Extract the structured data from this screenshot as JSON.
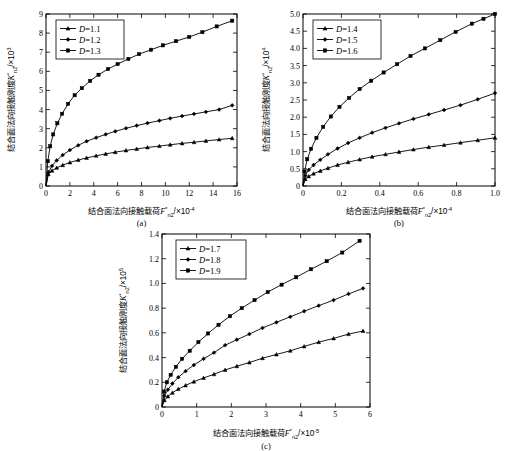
{
  "figure": {
    "background": "#ffffff",
    "ink": "#000000",
    "panels": [
      "a",
      "b",
      "c"
    ]
  },
  "chart_data": [
    {
      "id": "a",
      "type": "line",
      "caption": "(a)",
      "title": "",
      "xlabel_cn": "结合面法向接触载荷",
      "xlabel_sym": "F",
      "xlabel_sym_sup": "*",
      "xlabel_sym_sub": "n2",
      "xlabel_scale": "/×10",
      "xlabel_exp": "-4",
      "ylabel_cn": "结合面法向接触刚度",
      "ylabel_sym": "K",
      "ylabel_sym_sup": "*",
      "ylabel_sym_sub": "n2",
      "ylabel_scale": "/×10",
      "ylabel_exp": "3",
      "xlim": [
        0,
        16
      ],
      "ylim": [
        0,
        9
      ],
      "xticks": [
        0,
        2,
        4,
        6,
        8,
        10,
        12,
        14,
        16
      ],
      "xticklabels": [
        "0",
        "2",
        "4",
        "6",
        "8",
        "10",
        "12",
        "14",
        "16"
      ],
      "yticks": [
        0,
        1,
        2,
        3,
        4,
        5,
        6,
        7,
        8,
        9
      ],
      "yticklabels": [
        "0",
        "1",
        "2",
        "3",
        "4",
        "5",
        "6",
        "7",
        "8",
        "9"
      ],
      "grid": false,
      "legend_position": "upper-left",
      "series": [
        {
          "name": "D=1.1",
          "label_var": "D",
          "label_val": "1.1",
          "marker": "triangle",
          "x": [
            0,
            0.2,
            0.5,
            0.9,
            1.4,
            2.0,
            2.7,
            3.4,
            4.2,
            5.0,
            5.8,
            6.7,
            7.6,
            8.5,
            9.5,
            10.4,
            11.4,
            12.4,
            13.4,
            14.5,
            15.6
          ],
          "y": [
            0,
            0.62,
            0.8,
            0.95,
            1.09,
            1.23,
            1.36,
            1.47,
            1.58,
            1.68,
            1.77,
            1.86,
            1.94,
            2.02,
            2.09,
            2.16,
            2.23,
            2.29,
            2.36,
            2.43,
            2.5
          ]
        },
        {
          "name": "D=1.2",
          "label_var": "D",
          "label_val": "1.2",
          "marker": "diamond",
          "x": [
            0,
            0.2,
            0.5,
            0.9,
            1.4,
            2.0,
            2.7,
            3.4,
            4.2,
            5.0,
            5.8,
            6.7,
            7.6,
            8.5,
            9.5,
            10.4,
            11.4,
            12.4,
            13.4,
            14.5,
            15.6
          ],
          "y": [
            0,
            0.72,
            1.05,
            1.34,
            1.62,
            1.88,
            2.13,
            2.34,
            2.53,
            2.7,
            2.86,
            3.02,
            3.16,
            3.29,
            3.42,
            3.54,
            3.66,
            3.77,
            3.88,
            4.0,
            4.22
          ]
        },
        {
          "name": "D=1.3",
          "label_var": "D",
          "label_val": "1.3",
          "marker": "square",
          "x": [
            0,
            0.15,
            0.35,
            0.6,
            0.95,
            1.35,
            1.85,
            2.4,
            3.0,
            3.7,
            4.4,
            5.2,
            6.0,
            6.9,
            7.8,
            8.8,
            9.8,
            10.9,
            12.0,
            13.1,
            14.3,
            15.6
          ],
          "y": [
            0,
            1.3,
            2.08,
            2.7,
            3.28,
            3.78,
            4.3,
            4.75,
            5.12,
            5.5,
            5.82,
            6.12,
            6.38,
            6.65,
            6.9,
            7.13,
            7.36,
            7.58,
            7.8,
            8.05,
            8.35,
            8.65
          ]
        }
      ]
    },
    {
      "id": "b",
      "type": "line",
      "caption": "(b)",
      "title": "",
      "xlabel_cn": "结合面法向接触载荷",
      "xlabel_sym": "F",
      "xlabel_sym_sup": "*",
      "xlabel_sym_sub": "n2",
      "xlabel_scale": "/×10",
      "xlabel_exp": "-4",
      "ylabel_cn": "结合面法向接触刚度",
      "ylabel_sym": "K",
      "ylabel_sym_sup": "*",
      "ylabel_sym_sub": "n2",
      "ylabel_scale": "/×10",
      "ylabel_exp": "4",
      "xlim": [
        0,
        1.0
      ],
      "ylim": [
        0,
        5.0
      ],
      "xticks": [
        0,
        0.2,
        0.4,
        0.6,
        0.8,
        1.0
      ],
      "xticklabels": [
        "0",
        "0.2",
        "0.4",
        "0.6",
        "0.8",
        "1.0"
      ],
      "yticks": [
        0,
        0.5,
        1.0,
        1.5,
        2.0,
        2.5,
        3.0,
        3.5,
        4.0,
        4.5,
        5.0
      ],
      "yticklabels": [
        "0",
        "0.5",
        "1.0",
        "1.5",
        "2.0",
        "2.5",
        "3.0",
        "3.5",
        "4.0",
        "4.5",
        "5.0"
      ],
      "grid": false,
      "legend_position": "upper-left",
      "series": [
        {
          "name": "D=1.4",
          "label_var": "D",
          "label_val": "1.4",
          "marker": "triangle",
          "x": [
            0,
            0.012,
            0.03,
            0.055,
            0.09,
            0.13,
            0.18,
            0.235,
            0.295,
            0.36,
            0.43,
            0.5,
            0.575,
            0.655,
            0.735,
            0.82,
            0.91,
            1.0
          ],
          "y": [
            0,
            0.2,
            0.28,
            0.36,
            0.44,
            0.52,
            0.61,
            0.69,
            0.77,
            0.85,
            0.92,
            0.99,
            1.06,
            1.13,
            1.19,
            1.26,
            1.33,
            1.4
          ]
        },
        {
          "name": "D=1.5",
          "label_var": "D",
          "label_val": "1.5",
          "marker": "diamond",
          "x": [
            0,
            0.012,
            0.03,
            0.055,
            0.09,
            0.13,
            0.18,
            0.235,
            0.295,
            0.36,
            0.43,
            0.5,
            0.575,
            0.655,
            0.735,
            0.82,
            0.91,
            1.0
          ],
          "y": [
            0,
            0.3,
            0.47,
            0.61,
            0.76,
            0.92,
            1.09,
            1.25,
            1.4,
            1.55,
            1.69,
            1.82,
            1.95,
            2.08,
            2.21,
            2.35,
            2.52,
            2.7
          ]
        },
        {
          "name": "D=1.6",
          "label_var": "D",
          "label_val": "1.6",
          "marker": "square",
          "x": [
            0,
            0.008,
            0.022,
            0.042,
            0.07,
            0.105,
            0.145,
            0.19,
            0.24,
            0.295,
            0.355,
            0.42,
            0.49,
            0.56,
            0.635,
            0.715,
            0.795,
            0.88,
            0.94,
            1.0
          ],
          "y": [
            0,
            0.42,
            0.78,
            1.08,
            1.4,
            1.72,
            2.02,
            2.3,
            2.56,
            2.82,
            3.06,
            3.3,
            3.54,
            3.78,
            4.0,
            4.24,
            4.48,
            4.72,
            4.86,
            5.0
          ]
        }
      ]
    },
    {
      "id": "c",
      "type": "line",
      "caption": "(c)",
      "title": "",
      "xlabel_cn": "结合面法向接触载荷",
      "xlabel_sym": "F",
      "xlabel_sym_sup": "*",
      "xlabel_sym_sub": "n2",
      "xlabel_scale": "/×10",
      "xlabel_exp": "-5",
      "ylabel_cn": "结合面法向接触刚度",
      "ylabel_sym": "K",
      "ylabel_sym_sup": "*",
      "ylabel_sym_sub": "n2",
      "ylabel_scale": "/×10",
      "ylabel_exp": "5",
      "xlim": [
        0,
        6
      ],
      "ylim": [
        0,
        1.4
      ],
      "xticks": [
        0,
        1,
        2,
        3,
        4,
        5,
        6
      ],
      "xticklabels": [
        "0",
        "1",
        "2",
        "3",
        "4",
        "5",
        "6"
      ],
      "yticks": [
        0,
        0.2,
        0.4,
        0.6,
        0.8,
        1.0,
        1.2,
        1.4
      ],
      "yticklabels": [
        "0",
        "0.2",
        "0.4",
        "0.6",
        "0.8",
        "1.0",
        "1.2",
        "1.4"
      ],
      "grid": false,
      "legend_position": "upper-left",
      "series": [
        {
          "name": "D=1.7",
          "label_var": "D",
          "label_val": "1.7",
          "marker": "triangle",
          "x": [
            0,
            0.07,
            0.17,
            0.3,
            0.47,
            0.68,
            0.92,
            1.2,
            1.5,
            1.82,
            2.16,
            2.52,
            2.9,
            3.3,
            3.7,
            4.1,
            4.52,
            4.95,
            5.38,
            5.8
          ],
          "y": [
            0,
            0.055,
            0.085,
            0.115,
            0.145,
            0.175,
            0.205,
            0.235,
            0.265,
            0.3,
            0.33,
            0.36,
            0.395,
            0.425,
            0.455,
            0.49,
            0.525,
            0.555,
            0.59,
            0.615
          ]
        },
        {
          "name": "D=1.8",
          "label_var": "D",
          "label_val": "1.8",
          "marker": "diamond",
          "x": [
            0,
            0.07,
            0.17,
            0.3,
            0.47,
            0.68,
            0.92,
            1.2,
            1.5,
            1.82,
            2.16,
            2.52,
            2.9,
            3.3,
            3.7,
            4.1,
            4.52,
            4.95,
            5.38,
            5.8
          ],
          "y": [
            0,
            0.09,
            0.14,
            0.19,
            0.24,
            0.29,
            0.34,
            0.39,
            0.44,
            0.5,
            0.545,
            0.59,
            0.64,
            0.685,
            0.73,
            0.775,
            0.82,
            0.865,
            0.915,
            0.96
          ]
        },
        {
          "name": "D=1.9",
          "label_var": "D",
          "label_val": "1.9",
          "marker": "square",
          "x": [
            0,
            0.06,
            0.14,
            0.25,
            0.4,
            0.58,
            0.8,
            1.05,
            1.33,
            1.63,
            1.96,
            2.3,
            2.67,
            3.05,
            3.45,
            3.87,
            4.3,
            4.75,
            5.2,
            5.7
          ],
          "y": [
            0,
            0.125,
            0.2,
            0.26,
            0.325,
            0.39,
            0.455,
            0.525,
            0.595,
            0.665,
            0.735,
            0.8,
            0.865,
            0.93,
            0.99,
            1.05,
            1.115,
            1.18,
            1.25,
            1.345
          ]
        }
      ]
    }
  ]
}
